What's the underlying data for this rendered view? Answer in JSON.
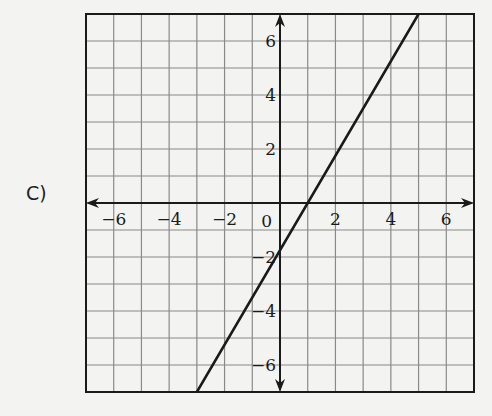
{
  "option_label": "C)",
  "chart_data": {
    "type": "line",
    "title": "",
    "xlabel": "",
    "ylabel": "",
    "xlim": [
      -7,
      7
    ],
    "ylim": [
      -7,
      7
    ],
    "grid": true,
    "x_ticks": [
      -6,
      -4,
      -2,
      2,
      4,
      6
    ],
    "y_ticks": [
      -6,
      -4,
      -2,
      2,
      4,
      6
    ],
    "origin_label": "0",
    "series": [
      {
        "name": "line",
        "equation": "y = 1.75x - 1.75",
        "points": [
          [
            -3,
            -7
          ],
          [
            0,
            -1.75
          ],
          [
            1,
            0
          ],
          [
            5,
            7
          ]
        ]
      }
    ]
  },
  "colors": {
    "background": "#f3f3f1",
    "grid": "#8a8a8a",
    "axis": "#1a1a1a",
    "line": "#1a1a1a"
  }
}
